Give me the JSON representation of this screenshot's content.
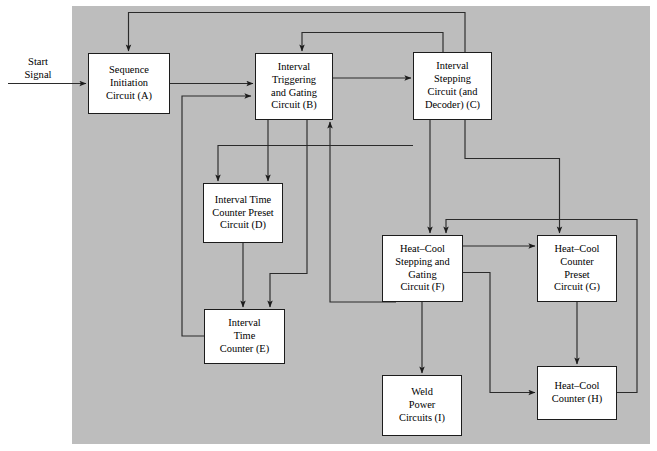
{
  "figure": {
    "canvas_color": "#bdbdbd",
    "node_fill": "#ffffff",
    "line_color": "#2b2b2b",
    "background": "#ffffff"
  },
  "external": {
    "start_signal": "Start\nSignal"
  },
  "nodes": {
    "a": {
      "id": "A",
      "label": "Sequence\nInitiation\nCircuit (A)"
    },
    "b": {
      "id": "B",
      "label": "Interval\nTriggering\nand Gating\nCircuit (B)"
    },
    "c": {
      "id": "C",
      "label": "Interval\nStepping\nCircuit (and\nDecoder) (C)"
    },
    "d": {
      "id": "D",
      "label": "Interval Time\nCounter Preset\nCircuit (D)"
    },
    "e": {
      "id": "E",
      "label": "Interval\nTime\nCounter (E)"
    },
    "f": {
      "id": "F",
      "label": "Heat–Cool\nStepping and\nGating\nCircuit (F)"
    },
    "g": {
      "id": "G",
      "label": "Heat–Cool\nCounter\nPreset\nCircuit (G)"
    },
    "h": {
      "id": "H",
      "label": "Heat–Cool\nCounter (H)"
    },
    "i": {
      "id": "I",
      "label": "Weld\nPower\nCircuits (I)"
    }
  },
  "connections": [
    {
      "name": "start-signal-to-a",
      "from": "Start Signal",
      "to": "A"
    },
    {
      "name": "a-to-b",
      "from": "A",
      "to": "B"
    },
    {
      "name": "b-to-c",
      "from": "B",
      "to": "C"
    },
    {
      "name": "b-to-d",
      "from": "B",
      "to": "D"
    },
    {
      "name": "b-to-e",
      "from": "B",
      "to": "E"
    },
    {
      "name": "c-to-a-feedback",
      "from": "C",
      "to": "A"
    },
    {
      "name": "c-to-b-feedback",
      "from": "C",
      "to": "B"
    },
    {
      "name": "c-to-d",
      "from": "C",
      "to": "D"
    },
    {
      "name": "c-to-f",
      "from": "C",
      "to": "F"
    },
    {
      "name": "c-to-g",
      "from": "C",
      "to": "G"
    },
    {
      "name": "d-to-e",
      "from": "D",
      "to": "E"
    },
    {
      "name": "e-to-b-feedback",
      "from": "E",
      "to": "B"
    },
    {
      "name": "f-to-g",
      "from": "F",
      "to": "G"
    },
    {
      "name": "f-to-h",
      "from": "F",
      "to": "H"
    },
    {
      "name": "f-to-i",
      "from": "F",
      "to": "I"
    },
    {
      "name": "f-to-b-feedback",
      "from": "F",
      "to": "B"
    },
    {
      "name": "g-to-h",
      "from": "G",
      "to": "H"
    },
    {
      "name": "h-to-f-feedback",
      "from": "H",
      "to": "F"
    }
  ]
}
